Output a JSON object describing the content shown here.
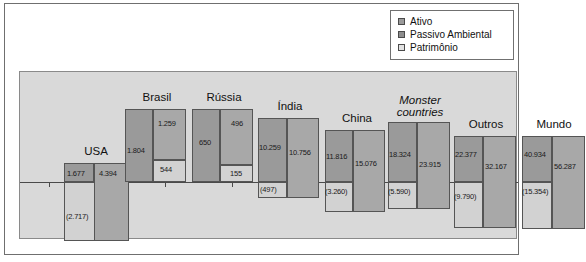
{
  "legend": {
    "items": [
      {
        "label": "Ativo",
        "color": "#9a9a9a"
      },
      {
        "label": "Passivo Ambiental",
        "color": "#a8a8a8"
      },
      {
        "label": "Patrimônio",
        "color": "#d2d2d2"
      }
    ]
  },
  "chart_data": {
    "type": "bar",
    "title": "",
    "xlabel": "",
    "ylabel": "",
    "grid": false,
    "legend_position": "top-right",
    "series_names": [
      "Ativo",
      "Passivo Ambiental",
      "Patrimônio"
    ],
    "categories": [
      "USA",
      "Brasil",
      "Rússia",
      "Índia",
      "China",
      "Monster countries",
      "Outros",
      "Mundo"
    ],
    "series": [
      {
        "name": "Ativo",
        "values": [
          1677,
          1804,
          650,
          10259,
          11816,
          18324,
          22377,
          40934
        ]
      },
      {
        "name": "Passivo Ambiental",
        "values": [
          4394,
          1259,
          496,
          10756,
          15076,
          23915,
          32167,
          56287
        ]
      },
      {
        "name": "Patrimônio",
        "values": [
          -2717,
          544,
          155,
          -497,
          -3260,
          -5590,
          -9790,
          -15354
        ]
      }
    ],
    "points": [
      {
        "category": "USA",
        "italic": false,
        "ativo": "1.677",
        "passivo": "4.394",
        "patrimonio": "(2.717)",
        "patrimonio_negative": true
      },
      {
        "category": "Brasil",
        "italic": false,
        "ativo": "1.804",
        "passivo": "1.259",
        "patrimonio": "544",
        "patrimonio_negative": false
      },
      {
        "category": "Rússia",
        "italic": false,
        "ativo": "650",
        "passivo": "496",
        "patrimonio": "155",
        "patrimonio_negative": false
      },
      {
        "category": "Índia",
        "italic": false,
        "ativo": "10.259",
        "passivo": "10.756",
        "patrimonio": "(497)",
        "patrimonio_negative": true
      },
      {
        "category": "China",
        "italic": false,
        "ativo": "11.816",
        "passivo": "15.076",
        "patrimonio": "(3.260)",
        "patrimonio_negative": true
      },
      {
        "category": "Monster countries",
        "italic": true,
        "ativo": "18.324",
        "passivo": "23.915",
        "patrimonio": "(5.590)",
        "patrimonio_negative": true
      },
      {
        "category": "Outros",
        "italic": false,
        "ativo": "22.377",
        "passivo": "32.167",
        "patrimonio": "(9.790)",
        "patrimonio_negative": true
      },
      {
        "category": "Mundo",
        "italic": false,
        "ativo": "40.934",
        "passivo": "56.287",
        "patrimonio": "(15.354)",
        "patrimonio_negative": true
      }
    ]
  },
  "groups": [
    {
      "label": "USA",
      "label_line2": "",
      "left": 44,
      "label_top": 73,
      "ativo": {
        "left": 0,
        "width": 30,
        "top": 91,
        "height": 19,
        "label": "1.677",
        "lx": 3,
        "ly": 97
      },
      "passivo": {
        "left": 30,
        "width": 35,
        "top": 91,
        "height": 78,
        "label": "4.394",
        "lx": 35,
        "ly": 97
      },
      "patrimonio": {
        "left": 0,
        "width": 32,
        "top": 110,
        "height": 59,
        "label": "(2.717)",
        "lx": 2,
        "ly": 140
      }
    },
    {
      "label": "Brasil",
      "label_line2": "",
      "left": 105,
      "label_top": 19,
      "ativo": {
        "left": 0,
        "width": 28,
        "top": 37,
        "height": 73,
        "label": "1.804",
        "lx": 2,
        "ly": 74
      },
      "passivo": {
        "left": 28,
        "width": 33,
        "top": 37,
        "height": 51,
        "label": "1.259",
        "lx": 33,
        "ly": 47
      },
      "patrimonio": {
        "left": 28,
        "width": 33,
        "top": 88,
        "height": 22,
        "label": "544",
        "lx": 35,
        "ly": 93
      }
    },
    {
      "label": "Rússia",
      "label_line2": "",
      "left": 172,
      "label_top": 19,
      "ativo": {
        "left": 0,
        "width": 28,
        "top": 37,
        "height": 73,
        "label": "650",
        "lx": 7,
        "ly": 66
      },
      "passivo": {
        "left": 28,
        "width": 33,
        "top": 37,
        "height": 56,
        "label": "496",
        "lx": 39,
        "ly": 47
      },
      "patrimonio": {
        "left": 28,
        "width": 33,
        "top": 93,
        "height": 17,
        "label": "155",
        "lx": 38,
        "ly": 97
      }
    },
    {
      "label": "Índia",
      "label_line2": "",
      "left": 238,
      "label_top": 28,
      "ativo": {
        "left": 0,
        "width": 29,
        "top": 46,
        "height": 64,
        "label": "10.259",
        "lx": 1,
        "ly": 71
      },
      "passivo": {
        "left": 29,
        "width": 32,
        "top": 46,
        "height": 80,
        "label": "10.756",
        "lx": 31,
        "ly": 76
      },
      "patrimonio": {
        "left": 0,
        "width": 29,
        "top": 110,
        "height": 16,
        "label": "(497)",
        "lx": 2,
        "ly": 113
      }
    },
    {
      "label": "China",
      "label_line2": "",
      "left": 305,
      "label_top": 40,
      "ativo": {
        "left": 0,
        "width": 28,
        "top": 58,
        "height": 52,
        "label": "11.816",
        "lx": 1,
        "ly": 80
      },
      "passivo": {
        "left": 28,
        "width": 32,
        "top": 58,
        "height": 82,
        "label": "15.076",
        "lx": 30,
        "ly": 87
      },
      "patrimonio": {
        "left": 0,
        "width": 28,
        "top": 110,
        "height": 30,
        "label": "(3.260)",
        "lx": 0,
        "ly": 115
      }
    },
    {
      "label": "Monster",
      "label_line2": "countries",
      "left": 368,
      "label_top": 22,
      "ativo": {
        "left": 0,
        "width": 29,
        "top": 50,
        "height": 60,
        "label": "18.324",
        "lx": 1,
        "ly": 78
      },
      "passivo": {
        "left": 29,
        "width": 33,
        "top": 50,
        "height": 87,
        "label": "23.915",
        "lx": 31,
        "ly": 88
      },
      "patrimonio": {
        "left": 0,
        "width": 29,
        "top": 110,
        "height": 27,
        "label": "(5.590)",
        "lx": 0,
        "ly": 115
      }
    },
    {
      "label": "Outros",
      "label_line2": "",
      "left": 434,
      "label_top": 46,
      "ativo": {
        "left": 0,
        "width": 29,
        "top": 64,
        "height": 46,
        "label": "22.377",
        "lx": 1,
        "ly": 78
      },
      "passivo": {
        "left": 29,
        "width": 33,
        "top": 64,
        "height": 92,
        "label": "32.167",
        "lx": 31,
        "ly": 90
      },
      "patrimonio": {
        "left": 0,
        "width": 29,
        "top": 110,
        "height": 46,
        "label": "(9.790)",
        "lx": 0,
        "ly": 120
      }
    },
    {
      "label": "Mundo",
      "label_line2": "",
      "left": 502,
      "label_top": 46,
      "ativo": {
        "left": 0,
        "width": 30,
        "top": 64,
        "height": 46,
        "label": "40.934",
        "lx": 2,
        "ly": 78
      },
      "passivo": {
        "left": 30,
        "width": 33,
        "top": 64,
        "height": 93,
        "label": "56.287",
        "lx": 32,
        "ly": 90
      },
      "patrimonio": {
        "left": 0,
        "width": 30,
        "top": 110,
        "height": 47,
        "label": "(15.354)",
        "lx": 0,
        "ly": 115
      }
    }
  ],
  "ticks": [
    29,
    80,
    145,
    212,
    278,
    345,
    410,
    470
  ]
}
